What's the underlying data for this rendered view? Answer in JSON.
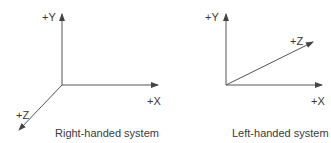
{
  "diagrams": [
    {
      "caption": "Right-handed system",
      "axes": {
        "y": "+Y",
        "x": "+X",
        "z": "+Z"
      }
    },
    {
      "caption": "Left-handed system",
      "axes": {
        "y": "+Y",
        "x": "+X",
        "z": "+Z"
      }
    }
  ],
  "colors": {
    "axis": "#555555",
    "text": "#3a3a3a",
    "background": "#ffffff"
  }
}
